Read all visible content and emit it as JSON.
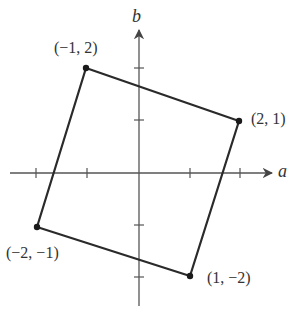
{
  "diagram": {
    "title": "",
    "type": "coordinate-plane-square",
    "axes": {
      "x_label": "a",
      "y_label": "b",
      "x_ticks": [
        -2,
        -1,
        1,
        2
      ],
      "y_ticks": [
        -2,
        -1,
        1,
        2
      ]
    },
    "vertices": [
      {
        "label": "(−1, 2)",
        "a": -1,
        "b": 2
      },
      {
        "label": "(2, 1)",
        "a": 2,
        "b": 1
      },
      {
        "label": "(1, −2)",
        "a": 1,
        "b": -2
      },
      {
        "label": "(−2, −1)",
        "a": -2,
        "b": -1
      }
    ],
    "colors": {
      "axis": "#555555",
      "shape": "#2a2a2a",
      "text": "#333333"
    }
  }
}
